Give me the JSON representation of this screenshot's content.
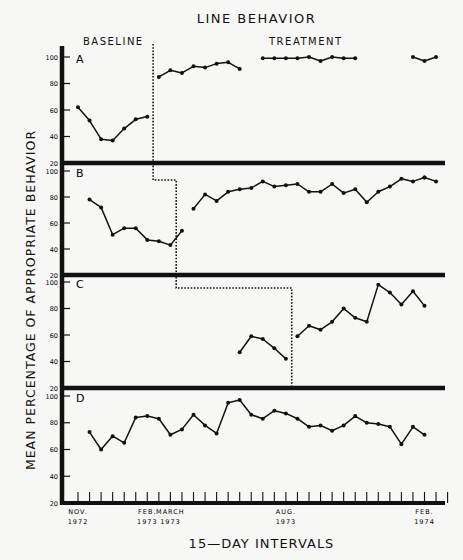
{
  "chart_data": {
    "type": "line",
    "title": "LINE BEHAVIOR",
    "xlabel": "15—DAY INTERVALS",
    "ylabel": "MEAN PERCENTAGE OF APPROPRIATE BEHAVIOR",
    "phases": [
      "BASELINE",
      "TREATMENT"
    ],
    "ylim": [
      20,
      100
    ],
    "yticks": [
      20,
      40,
      60,
      80,
      100
    ],
    "grid": false,
    "x_tick_count": 33,
    "x_tick_labels": [
      {
        "index": 0,
        "line1": "NOV.",
        "line2": "1972"
      },
      {
        "index": 6,
        "line1": "FEB.",
        "line2": "1973"
      },
      {
        "index": 8,
        "line1": "MARCH",
        "line2": "1973"
      },
      {
        "index": 18,
        "line1": "AUG.",
        "line2": "1973"
      },
      {
        "index": 30,
        "line1": "FEB.",
        "line2": "1974"
      }
    ],
    "panels": [
      {
        "label": "A",
        "phase_change_after_index": 6.5,
        "segments": [
          {
            "phase": "baseline",
            "x": [
              0,
              1,
              2,
              3,
              4,
              5,
              6
            ],
            "y": [
              62,
              52,
              38,
              37,
              46,
              53,
              55
            ]
          },
          {
            "phase": "treatment",
            "x": [
              7,
              8,
              9,
              10,
              11,
              12,
              13,
              14
            ],
            "y": [
              85,
              90,
              88,
              93,
              92,
              95,
              96,
              91
            ]
          },
          {
            "phase": "treatment",
            "x": [
              16,
              17,
              18,
              19,
              20,
              21,
              22,
              23,
              24
            ],
            "y": [
              99,
              99,
              99,
              99,
              100,
              97,
              100,
              99,
              99
            ]
          },
          {
            "phase": "treatment",
            "x": [
              29,
              30,
              31
            ],
            "y": [
              100,
              97,
              100
            ]
          }
        ]
      },
      {
        "label": "B",
        "phase_change_after_index": 8.5,
        "segments": [
          {
            "phase": "baseline",
            "x": [
              1,
              2,
              3,
              4,
              5,
              6,
              7,
              8,
              9
            ],
            "y": [
              78,
              72,
              51,
              56,
              56,
              47,
              46,
              43,
              54
            ]
          },
          {
            "phase": "treatment",
            "x": [
              10,
              11,
              12,
              13,
              14,
              15,
              16,
              17,
              18,
              19,
              20,
              21,
              22,
              23,
              24,
              25,
              26,
              27,
              28,
              29,
              30
            ],
            "y": [
              71,
              82,
              77,
              84,
              86,
              87,
              92,
              88,
              89,
              90,
              84,
              84,
              90,
              83,
              86,
              76,
              84,
              88,
              94,
              92,
              95
            ]
          },
          {
            "phase": "treatment",
            "x": [
              30,
              31
            ],
            "y": [
              95,
              92
            ]
          }
        ]
      },
      {
        "label": "C",
        "phase_change_after_index": 18.5,
        "segments": [
          {
            "phase": "baseline",
            "x": [
              14,
              15,
              16,
              17,
              18
            ],
            "y": [
              47,
              59,
              57,
              50,
              42
            ]
          },
          {
            "phase": "treatment",
            "x": [
              19,
              20,
              21,
              22,
              23,
              24,
              25,
              26,
              27,
              28,
              29,
              30
            ],
            "y": [
              59,
              67,
              64,
              70,
              80,
              73,
              70,
              98,
              92,
              83,
              93,
              82
            ]
          }
        ]
      },
      {
        "label": "D",
        "phase_change_after_index": null,
        "segments": [
          {
            "phase": "baseline",
            "x": [
              1,
              2,
              3,
              4,
              5,
              6,
              7,
              8,
              9,
              10,
              11,
              12,
              13,
              14,
              15,
              16,
              17,
              18,
              19,
              20,
              21,
              22,
              23,
              24,
              25,
              26,
              27,
              28,
              29,
              30
            ],
            "y": [
              73,
              60,
              70,
              65,
              84,
              85,
              83,
              71,
              75,
              86,
              78,
              72,
              95,
              97,
              86,
              83,
              89,
              87,
              83,
              77,
              78,
              74,
              78,
              85,
              80,
              79,
              77,
              64,
              77,
              71
            ]
          }
        ]
      }
    ]
  },
  "labels": {
    "title": "LINE BEHAVIOR",
    "baseline": "BASELINE",
    "treatment": "TREATMENT",
    "ylabel": "MEAN PERCENTAGE OF APPROPRIATE BEHAVIOR",
    "xtitle": "15—DAY INTERVALS",
    "panel_a": "A",
    "panel_b": "B",
    "panel_c": "C",
    "panel_d": "D"
  }
}
